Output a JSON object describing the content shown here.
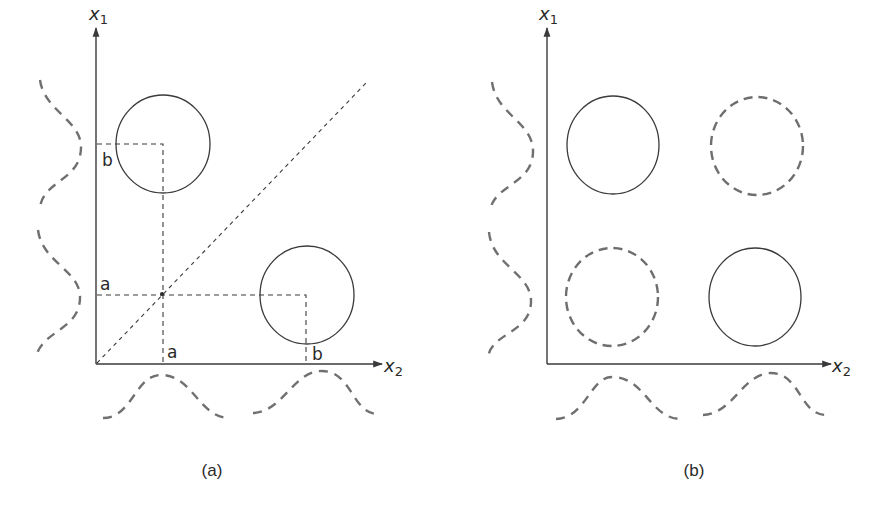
{
  "panels": [
    {
      "id": "a",
      "caption": "(a)",
      "y_axis": {
        "name": "x",
        "subscript": "1"
      },
      "x_axis": {
        "name": "x",
        "subscript": "2"
      },
      "tick_labels": {
        "x1_b": "b",
        "x1_a": "a",
        "x2_a": "a",
        "x2_b": "b"
      },
      "clusters": [
        {
          "position": "top-left",
          "style": "solid"
        },
        {
          "position": "bottom-right",
          "style": "solid"
        }
      ],
      "has_diagonal": true,
      "marginal_densities": {
        "x1": "bimodal",
        "x2": "bimodal"
      }
    },
    {
      "id": "b",
      "caption": "(b)",
      "y_axis": {
        "name": "x",
        "subscript": "1"
      },
      "x_axis": {
        "name": "x",
        "subscript": "2"
      },
      "clusters": [
        {
          "position": "top-left",
          "style": "solid"
        },
        {
          "position": "top-right",
          "style": "dashed"
        },
        {
          "position": "bottom-left",
          "style": "dashed"
        },
        {
          "position": "bottom-right",
          "style": "solid"
        }
      ],
      "has_diagonal": false,
      "marginal_densities": {
        "x1": "bimodal",
        "x2": "bimodal"
      }
    }
  ],
  "colors": {
    "line": "#3a3a3a",
    "dashed": "#6e6e6e"
  }
}
